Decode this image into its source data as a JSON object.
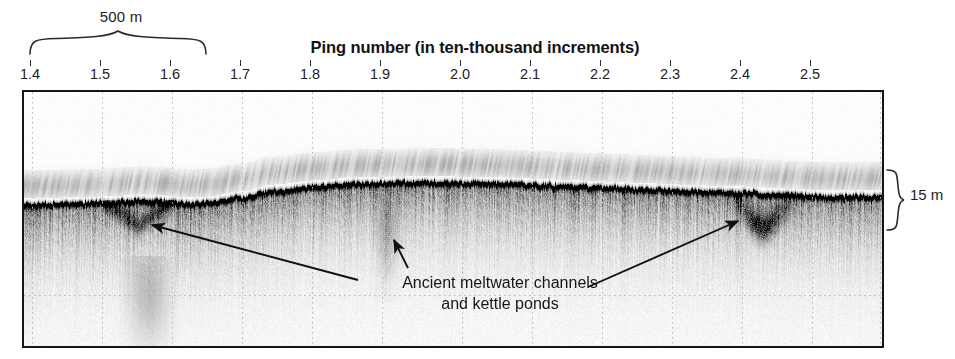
{
  "figure": {
    "type": "sub-bottom-profiler-sonar-profile",
    "axis_title": "Ping number (in ten-thousand increments)",
    "scalebar": {
      "label": "500 m",
      "spans_ping_range": [
        1.4,
        1.635
      ]
    },
    "depth_scale": {
      "label": "15 m"
    },
    "annotation": {
      "line1": "Ancient meltwater channels",
      "line2": "and kettle ponds"
    },
    "x_ticks": [
      {
        "label": "1.4",
        "value": 1.4,
        "x": 30
      },
      {
        "label": "1.5",
        "value": 1.5,
        "x": 100
      },
      {
        "label": "1.6",
        "value": 1.6,
        "x": 170
      },
      {
        "label": "1.7",
        "value": 1.7,
        "x": 240
      },
      {
        "label": "1.8",
        "value": 1.8,
        "x": 310
      },
      {
        "label": "1.9",
        "value": 1.9,
        "x": 380
      },
      {
        "label": "2.0",
        "value": 2.0,
        "x": 460
      },
      {
        "label": "2.1",
        "value": 2.1,
        "x": 530
      },
      {
        "label": "2.2",
        "value": 2.2,
        "x": 600
      },
      {
        "label": "2.3",
        "value": 2.3,
        "x": 670
      },
      {
        "label": "2.4",
        "value": 2.4,
        "x": 740
      },
      {
        "label": "2.5",
        "value": 2.5,
        "x": 810
      }
    ],
    "colors": {
      "ink": "#151515",
      "text": "#1d1d1d",
      "gridline": "#b9b9b9",
      "background": "#ffffff"
    },
    "panel": {
      "left": 22,
      "top": 90,
      "width": 858,
      "height": 254
    },
    "grid": {
      "vertical_x": [
        8,
        78,
        148,
        218,
        288,
        358,
        438,
        508,
        578,
        648,
        718,
        788,
        856
      ],
      "horizontal_y": [
        203
      ],
      "style": "dotted"
    },
    "arrows": [
      {
        "name": "arrow-left-channel",
        "from": [
          358,
          280
        ],
        "to": [
          152,
          225
        ]
      },
      {
        "name": "arrow-middle-channel",
        "from": [
          408,
          268
        ],
        "to": [
          394,
          240
        ]
      },
      {
        "name": "arrow-right-kettle",
        "from": [
          588,
          287
        ],
        "to": [
          738,
          221
        ]
      }
    ]
  },
  "chart_data": {
    "type": "heatmap",
    "title": "",
    "xlabel": "Ping number (in ten-thousand increments)",
    "ylabel": "",
    "xlim": [
      1.385,
      1.525
    ],
    "x_tick_values": [
      1.4,
      1.5,
      1.6,
      1.7,
      1.8,
      1.9,
      2.0,
      2.1,
      2.2,
      2.3,
      2.4,
      2.5
    ],
    "x_tick_labels": [
      "1.4",
      "1.5",
      "1.6",
      "1.7",
      "1.8",
      "1.9",
      "2.0",
      "2.1",
      "2.2",
      "2.3",
      "2.4",
      "2.5"
    ],
    "grid": true,
    "legend": "none",
    "colormap": "grayscale",
    "series": [
      {
        "name": "seabed-reflector-depth",
        "description": "Strong dark lake-bed reflector horizon traced across the profile (panel-relative y in px)",
        "x": [
          0,
          40,
          80,
          120,
          140,
          160,
          185,
          215,
          250,
          290,
          330,
          380,
          430,
          480,
          530,
          580,
          630,
          680,
          720,
          760,
          800,
          858
        ],
        "y": [
          112,
          111,
          110,
          108,
          109,
          111,
          110,
          105,
          98,
          94,
          91,
          90,
          90,
          91,
          93,
          95,
          97,
          99,
          100,
          102,
          104,
          104
        ]
      }
    ],
    "annotations": [
      {
        "text": "Ancient meltwater channels and kettle ponds",
        "points_to": [
          1.55,
          1.9,
          2.4
        ]
      },
      {
        "text": "500 m",
        "type": "horizontal-scale-brace"
      },
      {
        "text": "15 m",
        "type": "vertical-depth-brace"
      }
    ],
    "features": [
      {
        "name": "meltwater-channel-incision",
        "ping": 1.55,
        "shape": "V-shaped cut below reflector"
      },
      {
        "name": "kettle-pond-depression",
        "ping": 1.9,
        "shape": "faint vertical diffuse anomaly"
      },
      {
        "name": "kettle-pond-depression",
        "ping": 2.43,
        "shape": "dark irregular infilled basin"
      }
    ]
  }
}
